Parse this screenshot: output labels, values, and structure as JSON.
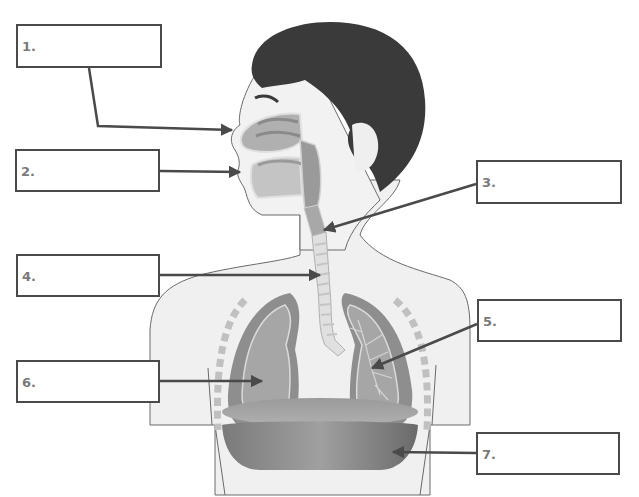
{
  "diagram": {
    "colors": {
      "hair": "#3a3a3a",
      "skin": "#f0f0f0",
      "organ_dark": "#8a8a8a",
      "organ_mid": "#a8a8a8",
      "organ_light": "#c8c8c8",
      "arrow": "#4a4a4a",
      "box_border": "#4a4a4a",
      "label_text": "#7a7a7a"
    },
    "labels": [
      {
        "id": "1",
        "text": "1.",
        "points_to": "nasal cavity"
      },
      {
        "id": "2",
        "text": "2.",
        "points_to": "mouth"
      },
      {
        "id": "3",
        "text": "3.",
        "points_to": "larynx / pharynx"
      },
      {
        "id": "4",
        "text": "4.",
        "points_to": "trachea"
      },
      {
        "id": "5",
        "text": "5.",
        "points_to": "bronchioles (left lung)"
      },
      {
        "id": "6",
        "text": "6.",
        "points_to": "lung"
      },
      {
        "id": "7",
        "text": "7.",
        "points_to": "diaphragm"
      }
    ]
  }
}
